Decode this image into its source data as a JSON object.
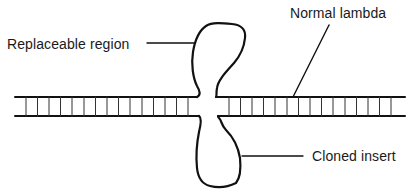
{
  "diagram": {
    "type": "lambda-phage-vector-schematic",
    "colors": {
      "background": "#ffffff",
      "stroke": "#111111",
      "text": "#1a1a1a"
    },
    "labels": {
      "replaceable_region": "Replaceable region",
      "normal_lambda": "Normal lambda",
      "cloned_insert": "Cloned insert"
    },
    "dna": {
      "top_rail_y": 97,
      "bottom_rail_y": 116,
      "left_segment": {
        "x_start": 15,
        "x_end": 197
      },
      "right_segment": {
        "x_start": 218,
        "x_end": 406
      },
      "rung_spacing": 11.6
    },
    "loops": {
      "upper": "Replaceable region (loop above DNA)",
      "lower": "Cloned insert (loop below DNA)"
    }
  }
}
